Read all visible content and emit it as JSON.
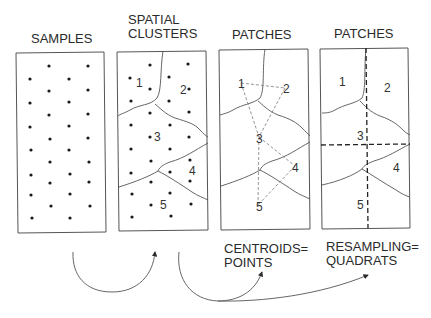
{
  "panels": [
    {
      "title_lines": [
        "SAMPLES"
      ],
      "caption_lines": []
    },
    {
      "title_lines": [
        "SPATIAL",
        "CLUSTERS"
      ],
      "cluster_labels": [
        "1",
        "2",
        "3",
        "4",
        "5"
      ],
      "caption_lines": []
    },
    {
      "title_lines": [
        "PATCHES"
      ],
      "centroid_labels": [
        "1",
        "2",
        "3",
        "4",
        "5"
      ],
      "caption_lines": [
        "CENTROIDS=",
        "POINTS"
      ]
    },
    {
      "title_lines": [
        "PATCHES"
      ],
      "patch_labels": [
        "1",
        "2",
        "3",
        "4",
        "5"
      ],
      "caption_lines": [
        "RESAMPLING=",
        "QUADRATS"
      ]
    }
  ],
  "colors": {
    "ink": "#2a2a2a",
    "border": "#555555",
    "line": "#555555",
    "dashed": "#888888",
    "background": "#ffffff"
  }
}
